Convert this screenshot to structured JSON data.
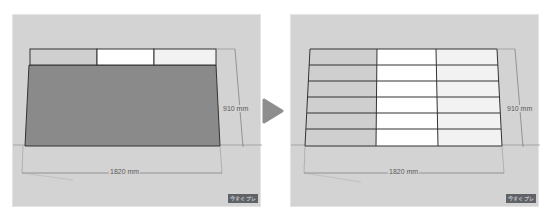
{
  "before": {
    "width_label": "1820 mm",
    "height_label": "910 mm",
    "badge": "今すぐプレ"
  },
  "after": {
    "width_label": "1820 mm",
    "height_label": "910 mm",
    "badge": "今すぐプレ",
    "rows": 6,
    "columns": 3
  },
  "transition": {
    "icon": "play-arrow-icon"
  },
  "colors": {
    "background": "#d3d3d3",
    "panel_dark": "#8a8a8a",
    "panel_mid": "#cfcfcf",
    "panel_light": "#ffffff",
    "arrow": "#8e8e8e"
  }
}
